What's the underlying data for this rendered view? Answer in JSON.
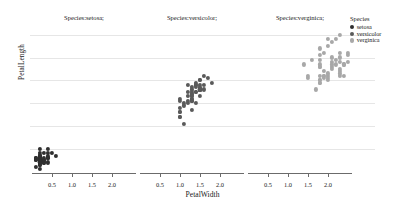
{
  "chart_data": {
    "type": "scatter",
    "title": "",
    "xlabel": "PetalWidth",
    "ylabel": "PetalLength",
    "xlim": [
      0.0,
      2.6
    ],
    "ylim": [
      0.8,
      7.2
    ],
    "xticks": [
      "0.5",
      "1.0",
      "1.5",
      "2.0"
    ],
    "xtick_values": [
      0.5,
      1.0,
      1.5,
      2.0
    ],
    "yticks": [],
    "grid": "horizontal",
    "legend_position": "right",
    "facet_by": "Species",
    "colors": {
      "setosa": "#2f2f2f",
      "versicolor": "#5a5a5a",
      "verginica": "#a8a8a8",
      "gridline": "#e6e6e6",
      "axis": "#6b6b6b",
      "text": "#1a1a1a",
      "background": "#ffffff"
    },
    "gridline_y_values": [
      6.9,
      5.9,
      4.9,
      3.9,
      2.9,
      1.9
    ],
    "panels": [
      {
        "title": "Species:setosa;",
        "series_name": "setosa",
        "color": "#2f2f2f",
        "points": [
          {
            "x": 0.2,
            "y": 1.4
          },
          {
            "x": 0.2,
            "y": 1.4
          },
          {
            "x": 0.2,
            "y": 1.3
          },
          {
            "x": 0.2,
            "y": 1.5
          },
          {
            "x": 0.2,
            "y": 1.4
          },
          {
            "x": 0.4,
            "y": 1.7
          },
          {
            "x": 0.3,
            "y": 1.4
          },
          {
            "x": 0.2,
            "y": 1.5
          },
          {
            "x": 0.2,
            "y": 1.4
          },
          {
            "x": 0.1,
            "y": 1.5
          },
          {
            "x": 0.2,
            "y": 1.5
          },
          {
            "x": 0.2,
            "y": 1.6
          },
          {
            "x": 0.1,
            "y": 1.4
          },
          {
            "x": 0.1,
            "y": 1.1
          },
          {
            "x": 0.2,
            "y": 1.2
          },
          {
            "x": 0.4,
            "y": 1.5
          },
          {
            "x": 0.4,
            "y": 1.3
          },
          {
            "x": 0.3,
            "y": 1.4
          },
          {
            "x": 0.3,
            "y": 1.7
          },
          {
            "x": 0.3,
            "y": 1.5
          },
          {
            "x": 0.2,
            "y": 1.7
          },
          {
            "x": 0.4,
            "y": 1.5
          },
          {
            "x": 0.2,
            "y": 1.0
          },
          {
            "x": 0.5,
            "y": 1.7
          },
          {
            "x": 0.2,
            "y": 1.9
          },
          {
            "x": 0.2,
            "y": 1.6
          },
          {
            "x": 0.4,
            "y": 1.6
          },
          {
            "x": 0.2,
            "y": 1.5
          },
          {
            "x": 0.2,
            "y": 1.4
          },
          {
            "x": 0.2,
            "y": 1.6
          },
          {
            "x": 0.2,
            "y": 1.6
          },
          {
            "x": 0.4,
            "y": 1.5
          },
          {
            "x": 0.1,
            "y": 1.5
          },
          {
            "x": 0.2,
            "y": 1.4
          },
          {
            "x": 0.2,
            "y": 1.5
          },
          {
            "x": 0.2,
            "y": 1.2
          },
          {
            "x": 0.2,
            "y": 1.3
          },
          {
            "x": 0.1,
            "y": 1.4
          },
          {
            "x": 0.2,
            "y": 1.3
          },
          {
            "x": 0.2,
            "y": 1.5
          },
          {
            "x": 0.3,
            "y": 1.3
          },
          {
            "x": 0.3,
            "y": 1.3
          },
          {
            "x": 0.2,
            "y": 1.3
          },
          {
            "x": 0.6,
            "y": 1.6
          },
          {
            "x": 0.4,
            "y": 1.9
          },
          {
            "x": 0.3,
            "y": 1.4
          },
          {
            "x": 0.2,
            "y": 1.6
          },
          {
            "x": 0.2,
            "y": 1.4
          },
          {
            "x": 0.2,
            "y": 1.5
          },
          {
            "x": 0.2,
            "y": 1.4
          }
        ]
      },
      {
        "title": "Species:versicolor;",
        "series_name": "versicolor",
        "color": "#5a5a5a",
        "points": [
          {
            "x": 1.4,
            "y": 4.7
          },
          {
            "x": 1.5,
            "y": 4.5
          },
          {
            "x": 1.5,
            "y": 4.9
          },
          {
            "x": 1.3,
            "y": 4.0
          },
          {
            "x": 1.5,
            "y": 4.6
          },
          {
            "x": 1.3,
            "y": 4.5
          },
          {
            "x": 1.6,
            "y": 4.7
          },
          {
            "x": 1.0,
            "y": 3.3
          },
          {
            "x": 1.3,
            "y": 4.6
          },
          {
            "x": 1.4,
            "y": 3.9
          },
          {
            "x": 1.0,
            "y": 3.5
          },
          {
            "x": 1.5,
            "y": 4.2
          },
          {
            "x": 1.0,
            "y": 4.0
          },
          {
            "x": 1.4,
            "y": 4.7
          },
          {
            "x": 1.3,
            "y": 3.6
          },
          {
            "x": 1.4,
            "y": 4.4
          },
          {
            "x": 1.5,
            "y": 4.5
          },
          {
            "x": 1.0,
            "y": 4.1
          },
          {
            "x": 1.5,
            "y": 4.5
          },
          {
            "x": 1.1,
            "y": 3.9
          },
          {
            "x": 1.8,
            "y": 4.8
          },
          {
            "x": 1.3,
            "y": 4.0
          },
          {
            "x": 1.5,
            "y": 4.9
          },
          {
            "x": 1.2,
            "y": 4.7
          },
          {
            "x": 1.3,
            "y": 4.3
          },
          {
            "x": 1.4,
            "y": 4.4
          },
          {
            "x": 1.4,
            "y": 4.8
          },
          {
            "x": 1.7,
            "y": 5.0
          },
          {
            "x": 1.5,
            "y": 4.5
          },
          {
            "x": 1.0,
            "y": 3.5
          },
          {
            "x": 1.1,
            "y": 3.8
          },
          {
            "x": 1.0,
            "y": 3.7
          },
          {
            "x": 1.2,
            "y": 3.9
          },
          {
            "x": 1.6,
            "y": 5.1
          },
          {
            "x": 1.5,
            "y": 4.5
          },
          {
            "x": 1.6,
            "y": 4.5
          },
          {
            "x": 1.5,
            "y": 4.7
          },
          {
            "x": 1.3,
            "y": 4.4
          },
          {
            "x": 1.3,
            "y": 4.1
          },
          {
            "x": 1.3,
            "y": 4.0
          },
          {
            "x": 1.2,
            "y": 4.4
          },
          {
            "x": 1.4,
            "y": 4.6
          },
          {
            "x": 1.2,
            "y": 4.0
          },
          {
            "x": 1.0,
            "y": 3.3
          },
          {
            "x": 1.3,
            "y": 4.2
          },
          {
            "x": 1.2,
            "y": 4.2
          },
          {
            "x": 1.3,
            "y": 4.2
          },
          {
            "x": 1.3,
            "y": 4.3
          },
          {
            "x": 1.1,
            "y": 3.0
          },
          {
            "x": 1.3,
            "y": 4.1
          }
        ]
      },
      {
        "title": "Species:verginica;",
        "series_name": "verginica",
        "color": "#a8a8a8",
        "points": [
          {
            "x": 2.5,
            "y": 6.0
          },
          {
            "x": 1.9,
            "y": 5.1
          },
          {
            "x": 2.1,
            "y": 5.9
          },
          {
            "x": 1.8,
            "y": 5.6
          },
          {
            "x": 2.2,
            "y": 5.8
          },
          {
            "x": 2.1,
            "y": 6.6
          },
          {
            "x": 1.7,
            "y": 4.5
          },
          {
            "x": 1.8,
            "y": 6.3
          },
          {
            "x": 1.8,
            "y": 5.8
          },
          {
            "x": 2.5,
            "y": 6.1
          },
          {
            "x": 2.0,
            "y": 5.1
          },
          {
            "x": 1.9,
            "y": 5.3
          },
          {
            "x": 2.1,
            "y": 5.5
          },
          {
            "x": 2.0,
            "y": 5.0
          },
          {
            "x": 2.4,
            "y": 5.1
          },
          {
            "x": 2.3,
            "y": 5.3
          },
          {
            "x": 1.8,
            "y": 5.5
          },
          {
            "x": 2.2,
            "y": 6.7
          },
          {
            "x": 2.3,
            "y": 6.9
          },
          {
            "x": 1.5,
            "y": 5.0
          },
          {
            "x": 2.3,
            "y": 5.7
          },
          {
            "x": 2.0,
            "y": 4.9
          },
          {
            "x": 2.0,
            "y": 6.7
          },
          {
            "x": 1.8,
            "y": 4.9
          },
          {
            "x": 2.1,
            "y": 5.7
          },
          {
            "x": 1.8,
            "y": 6.0
          },
          {
            "x": 1.8,
            "y": 4.8
          },
          {
            "x": 1.8,
            "y": 4.9
          },
          {
            "x": 2.1,
            "y": 5.6
          },
          {
            "x": 1.6,
            "y": 5.8
          },
          {
            "x": 1.9,
            "y": 6.1
          },
          {
            "x": 2.0,
            "y": 6.4
          },
          {
            "x": 2.2,
            "y": 5.6
          },
          {
            "x": 1.5,
            "y": 5.1
          },
          {
            "x": 1.4,
            "y": 5.6
          },
          {
            "x": 2.3,
            "y": 6.1
          },
          {
            "x": 2.4,
            "y": 5.6
          },
          {
            "x": 1.8,
            "y": 5.5
          },
          {
            "x": 1.8,
            "y": 4.8
          },
          {
            "x": 2.1,
            "y": 5.4
          },
          {
            "x": 2.4,
            "y": 5.6
          },
          {
            "x": 2.3,
            "y": 5.1
          },
          {
            "x": 1.9,
            "y": 5.1
          },
          {
            "x": 2.3,
            "y": 5.9
          },
          {
            "x": 2.5,
            "y": 5.7
          },
          {
            "x": 2.3,
            "y": 5.2
          },
          {
            "x": 1.9,
            "y": 5.0
          },
          {
            "x": 2.0,
            "y": 5.2
          },
          {
            "x": 2.3,
            "y": 5.4
          },
          {
            "x": 1.8,
            "y": 5.1
          }
        ]
      }
    ],
    "legend": {
      "title": "Species",
      "entries": [
        {
          "label": "setosa",
          "color": "#2f2f2f"
        },
        {
          "label": "versicolor",
          "color": "#5a5a5a"
        },
        {
          "label": "verginica",
          "color": "#a8a8a8"
        }
      ]
    }
  }
}
